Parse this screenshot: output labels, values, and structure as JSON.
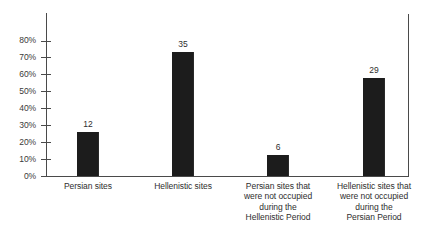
{
  "chart_data": {
    "type": "bar",
    "title": "",
    "subtitle": "",
    "xlabel": "",
    "ylabel": "",
    "ylim": [
      0,
      80
    ],
    "ytick_suffix": "%",
    "grid": false,
    "legend": null,
    "bar_color": "#1c1c1c",
    "axis_color": "#4a4a4a",
    "categories": [
      "Persian sites",
      "Hellenistic sites",
      "Persian sites that were not occupied during the Hellenistic Period",
      "Hellenistic sites that were not occupied during the Persian Period"
    ],
    "category_lines": [
      [
        "Persian sites"
      ],
      [
        "Hellenistic sites"
      ],
      [
        "Persian sites that",
        "were not occupied",
        "during the",
        "Hellenistic Period"
      ],
      [
        "Hellenistic sites that",
        "were not occupied",
        "during the",
        "Persian Period"
      ]
    ],
    "values": [
      26,
      73,
      12.5,
      58
    ],
    "data_labels": [
      "12",
      "35",
      "6",
      "29"
    ],
    "yticks": [
      0,
      10,
      20,
      30,
      40,
      50,
      60,
      70,
      80
    ],
    "ytick_labels": [
      "0%",
      "10%",
      "20%",
      "30%",
      "40%",
      "50%",
      "60%",
      "70%",
      "80%"
    ]
  }
}
